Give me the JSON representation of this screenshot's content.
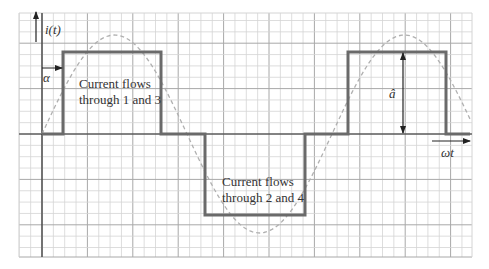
{
  "diagram": {
    "type": "waveform",
    "axis_labels": {
      "y": "i(t)",
      "x": "ωt",
      "delay": "α",
      "amplitude": "â"
    },
    "annotations": {
      "positive_line1": "Current flows",
      "positive_line2": "through 1 and 3",
      "negative_line1": "Current flows",
      "negative_line2": "through 2 and 4"
    },
    "colors": {
      "grid_minor": "#d4d4d4",
      "grid_major": "#a8a8a8",
      "axis": "#333333",
      "square_wave": "#6a6a6a",
      "sine_wave": "#b0b0b0"
    }
  }
}
